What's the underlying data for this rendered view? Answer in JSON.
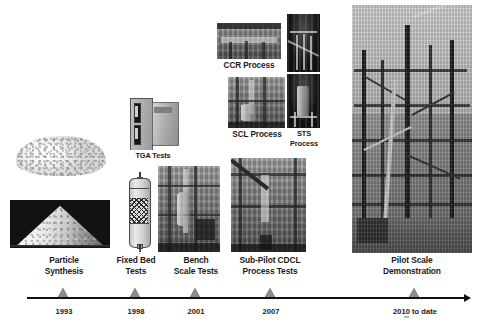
{
  "figure": {
    "background_color": "#ffffff",
    "axis_color": "#111111",
    "marker_color": "#8c8c8c",
    "text_color": "#1a1a1a"
  },
  "timeline": {
    "axis_label": "development timeline arrow",
    "milestones": [
      {
        "stage": "Particle Synthesis",
        "stage_line1": "Particle",
        "stage_line2": "Synthesis",
        "year": "1993"
      },
      {
        "stage": "Fixed Bed Tests",
        "stage_line1": "Fixed Bed",
        "stage_line2": "Tests",
        "year": "1998"
      },
      {
        "stage": "Bench Scale Tests",
        "stage_line1": "Bench",
        "stage_line2": "Scale Tests",
        "year": "2001"
      },
      {
        "stage": "Sub-Pilot CDCL Process Tests",
        "stage_line1": "Sub-Pilot CDCL",
        "stage_line2": "Process Tests",
        "year": "2007"
      },
      {
        "stage": "Pilot Scale Demonstration",
        "stage_line1": "Pilot Scale",
        "stage_line2": "Demonstration",
        "year": "2010 to date"
      }
    ]
  },
  "photos": {
    "particle_powder": {
      "caption": "",
      "alt": "white synthesized particle powder heap on white background"
    },
    "particle_cone": {
      "caption": "",
      "alt": "conical pile of white particles photographed on black background"
    },
    "tga_instrument": {
      "caption": "TGA Tests",
      "alt": "thermogravimetric analyzer instrument"
    },
    "fixed_bed_reactor": {
      "caption": "",
      "alt": "fixed bed reactor schematic with packed bed section"
    },
    "bench_scale_unit": {
      "caption": "",
      "alt": "bench scale reactor test rig photograph"
    },
    "ccr_process": {
      "caption": "CCR Process",
      "alt": "CCR process reactor photograph"
    },
    "scl_process": {
      "caption": "SCL Process",
      "alt": "SCL process reactor photograph"
    },
    "sts_process_top": {
      "caption": "",
      "alt": "STS process upper reactor section photograph"
    },
    "sts_process_bottom": {
      "caption": "STS Process",
      "caption_line1": "STS",
      "caption_line2": "Process",
      "alt": "STS process lower reactor section photograph"
    },
    "sub_pilot_cdcl": {
      "caption": "",
      "alt": "sub-pilot CDCL unit photograph with stairs and structure"
    },
    "pilot_plant": {
      "caption": "",
      "alt": "large pilot scale chemical looping demonstration steel structure"
    }
  },
  "labels": {
    "ccr_process": "CCR Process",
    "scl_process": "SCL Process",
    "sts_process_l1": "STS",
    "sts_process_l2": "Process",
    "tga_tests": "TGA Tests"
  }
}
